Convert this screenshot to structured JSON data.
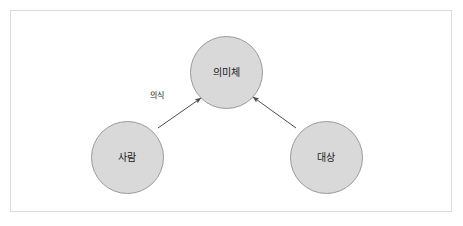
{
  "diagram": {
    "title": "",
    "background_color": "#ffffff",
    "frame": {
      "border_color": "#dcdcdc",
      "fill_color": "#ffffff"
    },
    "node_style": {
      "fill_color": "#d9d9d9",
      "border_color": "#9a9a9a",
      "text_color": "#1a1a1a"
    },
    "edge_style": {
      "line_color": "#4d4d4d",
      "arrowhead": "solid-filled"
    },
    "nodes": [
      {
        "id": "semantic-body",
        "label": "의미체",
        "position": "top-center"
      },
      {
        "id": "person",
        "label": "사람",
        "position": "bottom-left"
      },
      {
        "id": "object",
        "label": "대상",
        "position": "bottom-right"
      }
    ],
    "edges": [
      {
        "id": "person-to-semantic-body",
        "from": "person",
        "to": "semantic-body",
        "label": "의식",
        "direction": "one-way"
      },
      {
        "id": "object-to-semantic-body",
        "from": "object",
        "to": "semantic-body",
        "label": "",
        "direction": "one-way"
      }
    ]
  }
}
